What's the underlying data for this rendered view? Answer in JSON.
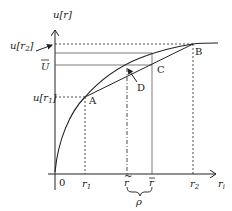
{
  "diagram": {
    "y_axis_label": "u[r]",
    "x_axis_label": "r",
    "x_axis_subscript": "i",
    "origin_label": "0",
    "y_labels": {
      "u_r2": "u[r",
      "u_r2_sub": "2",
      "u_bar": "U",
      "u_r1": "u[r",
      "u_r1_sub": "1"
    },
    "x_labels": {
      "r1": "r",
      "r1_sub": "1",
      "r_tilde": "r",
      "r_bar": "r",
      "r2": "r",
      "r2_sub": "2",
      "rho": "ρ"
    },
    "points": {
      "A": "A",
      "B": "B",
      "C": "C",
      "D": "D"
    },
    "colors": {
      "ink": "#222222",
      "background": "#ffffff"
    }
  }
}
